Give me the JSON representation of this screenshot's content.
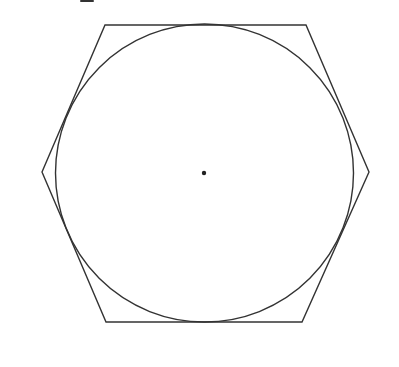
{
  "diagram": {
    "title": "",
    "background": "#ffffff",
    "stroke_color": "#333333",
    "stroke_width": 1.4,
    "hexagon": {
      "vertices": [
        [
          105,
          25
        ],
        [
          306,
          25
        ],
        [
          369,
          172
        ],
        [
          302,
          322
        ],
        [
          106,
          322
        ],
        [
          42,
          172
        ]
      ]
    },
    "circle": {
      "cx": 204.5,
      "cy": 173,
      "r": 149
    },
    "center_point": {
      "cx": 204,
      "cy": 173,
      "r": 2.2
    },
    "top_fragment": {
      "x": 80,
      "y": 0,
      "width": 14,
      "height": 2
    }
  }
}
